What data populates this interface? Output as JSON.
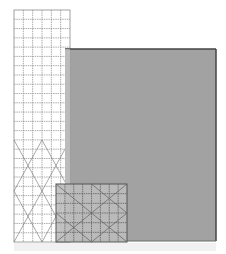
{
  "diagram": {
    "canvas": {
      "width": 226,
      "height": 254,
      "background": "#ffffff"
    },
    "tall_ruler": {
      "label": "",
      "x": 14,
      "y": 10,
      "width": 56,
      "height": 232,
      "columns": 6,
      "rows": 25,
      "fill": "#ffffff",
      "line_color": "#8a8a8a",
      "diagonal_color": "#6e6e6e",
      "diagonals_from_y": 140
    },
    "large_square": {
      "label": "",
      "x": 65,
      "y": 49,
      "width": 151,
      "height": 192,
      "fill": "#9a9a9a",
      "border_color": "#444444"
    },
    "small_ruler": {
      "label": "",
      "x": 56,
      "y": 184,
      "width": 71,
      "height": 58,
      "columns": 8,
      "rows": 6,
      "fill": "#bdbdbd",
      "line_color": "#5e5e5e",
      "border_color": "#555555"
    },
    "reflection": {
      "y": 243,
      "height": 8,
      "color": "#f1f1f1"
    }
  }
}
